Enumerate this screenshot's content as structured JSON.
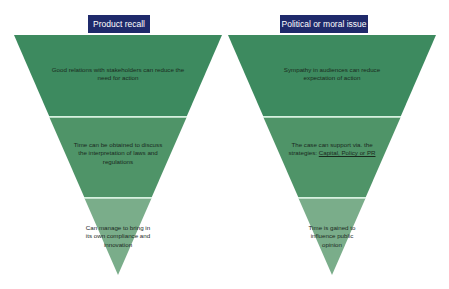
{
  "colors": {
    "header_bg": "#1f2a6b",
    "header_text": "#ffffff",
    "tier_top": "#3d8a5f",
    "tier_middle": "#4f9468",
    "tier_bottom": "#7aad8a",
    "divider": "#c8ecd4",
    "text": "#1a2a1e"
  },
  "funnels": [
    {
      "title": "Product recall",
      "tiers": [
        {
          "text": "Good relations with stakeholders can reduce the need for action"
        },
        {
          "text": "Time can be obtained to discuss the interpretation of laws and regulations"
        },
        {
          "text": "Can manage to bring in its own compliance and innovation"
        }
      ]
    },
    {
      "title": "Political or moral issue",
      "tiers": [
        {
          "text": "Sympathy in audiences can reduce expectation of action"
        },
        {
          "text_prefix": "The case can support via. the strategies: ",
          "text_link": "Capital, Policy or PR"
        },
        {
          "text": "Time is gained to influence public opinion"
        }
      ]
    }
  ]
}
